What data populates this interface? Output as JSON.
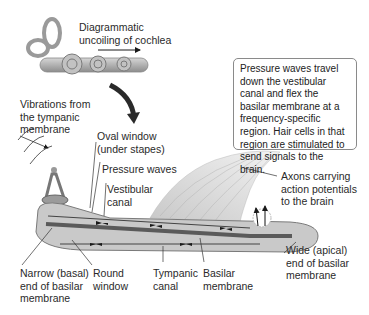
{
  "diagram": {
    "title_labels": {
      "uncoiling": [
        "Diagrammatic",
        "uncoiling of cochlea"
      ]
    },
    "info_box": {
      "text": "Pressure waves travel down the vestibular canal and flex the basilar membrane at a frequency-specific region. Hair cells in that region are stimulated to send signals to the brain."
    },
    "labels": {
      "vibrations": [
        "Vibrations from",
        "the tympanic",
        "membrane"
      ],
      "oval_window": [
        "Oval window",
        "(under stapes)"
      ],
      "pressure_waves": [
        "Pressure waves"
      ],
      "vestibular_canal": [
        "Vestibular",
        "canal"
      ],
      "axons": [
        "Axons carrying",
        "action potentials",
        "to the brain"
      ],
      "wide_end": [
        "Wide (apical)",
        "end of basilar",
        "membrane"
      ],
      "narrow_end": [
        "Narrow (basal)",
        "end of basilar",
        "membrane"
      ],
      "round_window": [
        "Round",
        "window"
      ],
      "tympanic_canal": [
        "Tympanic",
        "canal"
      ],
      "basilar_membrane": [
        "Basilar",
        "membrane"
      ]
    },
    "colors": {
      "cochlea_fill": "#b5b5b5",
      "cochlea_dark": "#6e6e6e",
      "membrane": "#5a5a5a",
      "nerve": "#d8d8d8",
      "arrow": "#1a1a1a",
      "box_border": "#8a8a8a"
    }
  }
}
